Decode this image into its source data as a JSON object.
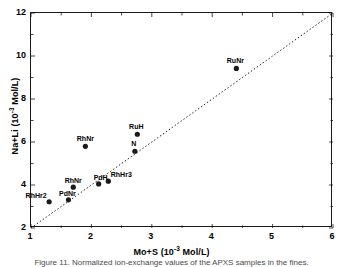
{
  "chart_data": {
    "type": "scatter",
    "title": "",
    "xlabel": "Mo+S (10-3 Mol/L)",
    "xlabel_base": "Mo+S (10",
    "xlabel_exp": "-3",
    "xlabel_tail": " Mol/L)",
    "ylabel_base": "Na+Li (10",
    "ylabel_exp": "-3",
    "ylabel_tail": " Mol/L)",
    "ylabel": "Na+Li (10-3 Mol/L)",
    "xlim": [
      1,
      6
    ],
    "ylim": [
      2,
      12
    ],
    "xticks": [
      1,
      2,
      3,
      4,
      5,
      6
    ],
    "yticks": [
      2,
      4,
      6,
      8,
      10,
      12
    ],
    "grid": false,
    "legend": "none",
    "reference_line": {
      "name": "one-to-one-dotted-line",
      "style": "dotted",
      "from": [
        1,
        2
      ],
      "to": [
        6,
        12
      ]
    },
    "points": [
      {
        "label": "RhHr2",
        "x": 1.3,
        "y": 3.22,
        "label_dx": -13,
        "label_dy": -3
      },
      {
        "label": "PdNr",
        "x": 1.62,
        "y": 3.31,
        "label_dx": -1,
        "label_dy": -3
      },
      {
        "label": "RhNr",
        "x": 1.7,
        "y": 3.9,
        "label_dx": 0,
        "label_dy": -3
      },
      {
        "label": "PdH",
        "x": 2.12,
        "y": 4.05,
        "label_dx": 2,
        "label_dy": -3
      },
      {
        "label": "RhHr3",
        "x": 2.28,
        "y": 4.18,
        "label_dx": 13,
        "label_dy": -3
      },
      {
        "label": "RhNr",
        "x": 1.9,
        "y": 5.8,
        "label_dx": 0,
        "label_dy": -4
      },
      {
        "label": "N",
        "x": 2.72,
        "y": 5.57,
        "label_dx": -1,
        "label_dy": -4
      },
      {
        "label": "RuH",
        "x": 2.76,
        "y": 6.36,
        "label_dx": -1,
        "label_dy": -4
      },
      {
        "label": "RuNr",
        "x": 4.4,
        "y": 9.42,
        "label_dx": -1,
        "label_dy": -4
      }
    ],
    "marker": {
      "shape": "circle",
      "color": "#1a1a1a",
      "size": 4
    }
  },
  "caption": {
    "text": "Figure 11. Normalized ion-exchange values of the APXS samples in the fines."
  }
}
